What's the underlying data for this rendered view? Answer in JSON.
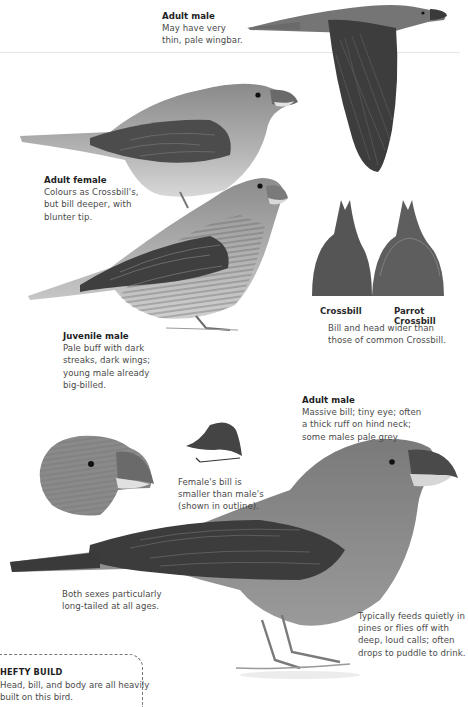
{
  "page": {
    "subject": "Parrot Crossbill",
    "colors": {
      "background": "#ffffff",
      "text": "#4a4a4a",
      "heading": "#1e1e1e",
      "plumage_dark": "#3c3c3c",
      "plumage_mid": "#6e6e6e",
      "plumage_light": "#a8a8a8"
    }
  },
  "annotations": {
    "flying_male": {
      "title": "Adult male",
      "text": "May have very\nthin, pale wingbar."
    },
    "adult_female": {
      "title": "Adult female",
      "text": "Colours as Crossbill's,\nbut bill deeper, with\nblunter tip."
    },
    "juvenile_male": {
      "title": "Juvenile male",
      "text": "Pale buff with dark\nstreaks, dark wings;\nyoung male already\nbig-billed."
    },
    "bill_comparison": {
      "labels": [
        "Crossbill",
        "Parrot Crossbill"
      ],
      "text": "Bill and head wider than\nthose of common Crossbill."
    },
    "adult_male": {
      "title": "Adult male",
      "text": "Massive bill; tiny eye; often\na thick ruff on hind neck;\nsome males pale grey."
    },
    "female_bill": {
      "text": "Female's bill is\nsmaller than male's\n(shown in outline)."
    },
    "tail_note": {
      "text": "Both sexes particularly\nlong-tailed at all ages."
    },
    "feeding_note": {
      "text": "Typically feeds quietly in\npines or flies off with\ndeep, loud calls; often\ndrops to puddle to drink."
    }
  },
  "callout": {
    "title": "HEFTY BUILD",
    "text": "Head, bill, and body are all heavily\nbuilt on this bird."
  }
}
